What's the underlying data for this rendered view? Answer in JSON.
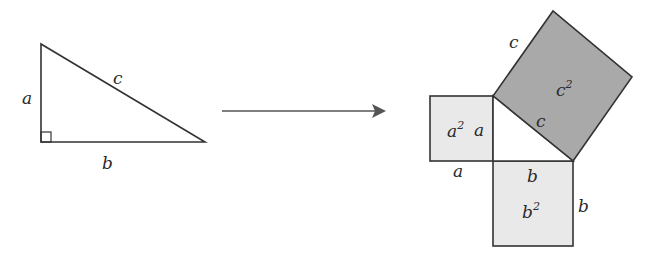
{
  "diagram": {
    "colors": {
      "stroke": "#333333",
      "square_light": "#e9e9e9",
      "square_dark": "#a9a9a9",
      "arrow": "#555555",
      "background": "#ffffff"
    },
    "left_triangle": {
      "labels": {
        "a": "a",
        "b": "b",
        "c": "c"
      },
      "right_angle_marker": true
    },
    "arrow": {
      "direction": "right"
    },
    "right_figure": {
      "squares": [
        {
          "name": "a-squared",
          "base": "a",
          "exp": "2",
          "side_labels": [
            "a",
            "a"
          ],
          "fill": "light"
        },
        {
          "name": "b-squared",
          "base": "b",
          "exp": "2",
          "side_labels": [
            "b",
            "b"
          ],
          "fill": "light"
        },
        {
          "name": "c-squared",
          "base": "c",
          "exp": "2",
          "side_labels": [
            "c",
            "c"
          ],
          "fill": "dark"
        }
      ]
    }
  }
}
